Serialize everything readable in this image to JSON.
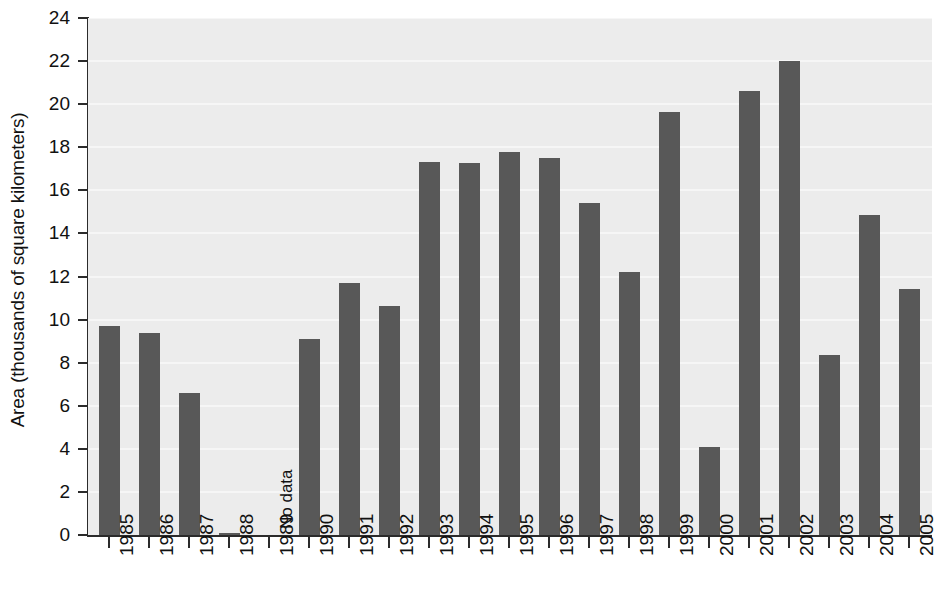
{
  "chart_data": {
    "type": "bar",
    "title": "",
    "xlabel": "",
    "ylabel": "Area (thousands of square kilometers)",
    "ylim": [
      0,
      24
    ],
    "ytick_step": 2,
    "yticks": [
      0,
      2,
      4,
      6,
      8,
      10,
      12,
      14,
      16,
      18,
      20,
      22,
      24
    ],
    "grid": true,
    "grid_axis": "y",
    "legend": "none",
    "categories": [
      "1985",
      "1986",
      "1987",
      "1988",
      "1989",
      "1990",
      "1991",
      "1992",
      "1993",
      "1994",
      "1995",
      "1996",
      "1997",
      "1998",
      "1999",
      "2000",
      "2001",
      "2002",
      "2003",
      "2004",
      "2005"
    ],
    "values": [
      9.7,
      9.4,
      6.6,
      0.1,
      null,
      9.1,
      11.7,
      10.65,
      17.3,
      17.25,
      17.8,
      17.5,
      15.4,
      12.2,
      19.65,
      4.1,
      20.6,
      22.0,
      8.35,
      14.85,
      11.4
    ],
    "annotations": [
      {
        "text": "No data",
        "category": "1989",
        "rotation": 90
      }
    ],
    "colors": {
      "bar": "#585858",
      "plot_background": "#ececec",
      "gridline": "#f6f6f6",
      "axis": "#2b2b2b",
      "text": "#111111",
      "figure_background": "#ffffff"
    }
  }
}
